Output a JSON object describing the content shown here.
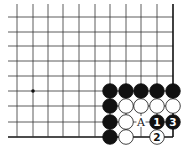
{
  "diagram": {
    "type": "go-board-corner",
    "grid": {
      "columns_x": [
        17,
        33,
        48,
        63,
        79,
        95,
        110,
        126,
        141,
        157,
        173
      ],
      "rows_y": [
        17,
        32,
        46,
        61,
        76,
        91,
        106,
        122,
        137
      ],
      "left_extent": 8,
      "top_extent": 4,
      "right_edge_x": 173,
      "bottom_edge_y": 137,
      "line_color": "#333333",
      "edge_color": "#111111"
    },
    "hoshi": [
      {
        "col": 1,
        "row": 5
      }
    ],
    "stone_radius": 7.3,
    "stones": [
      {
        "col": 6,
        "row": 5,
        "color": "black",
        "label": ""
      },
      {
        "col": 7,
        "row": 5,
        "color": "black",
        "label": ""
      },
      {
        "col": 8,
        "row": 5,
        "color": "black",
        "label": ""
      },
      {
        "col": 9,
        "row": 5,
        "color": "black",
        "label": ""
      },
      {
        "col": 10,
        "row": 5,
        "color": "black",
        "label": ""
      },
      {
        "col": 6,
        "row": 6,
        "color": "black",
        "label": ""
      },
      {
        "col": 7,
        "row": 6,
        "color": "white",
        "label": ""
      },
      {
        "col": 8,
        "row": 6,
        "color": "white",
        "label": ""
      },
      {
        "col": 9,
        "row": 6,
        "color": "white",
        "label": ""
      },
      {
        "col": 10,
        "row": 6,
        "color": "white",
        "label": ""
      },
      {
        "col": 6,
        "row": 7,
        "color": "black",
        "label": ""
      },
      {
        "col": 7,
        "row": 7,
        "color": "white",
        "label": ""
      },
      {
        "col": 9,
        "row": 7,
        "color": "black",
        "label": "1"
      },
      {
        "col": 10,
        "row": 7,
        "color": "black",
        "label": "3"
      },
      {
        "col": 6,
        "row": 8,
        "color": "black",
        "label": ""
      },
      {
        "col": 7,
        "row": 8,
        "color": "white",
        "label": ""
      },
      {
        "col": 9,
        "row": 8,
        "color": "white",
        "label": "2"
      }
    ],
    "markers": [
      {
        "col": 8,
        "row": 7,
        "label": "A"
      }
    ]
  }
}
